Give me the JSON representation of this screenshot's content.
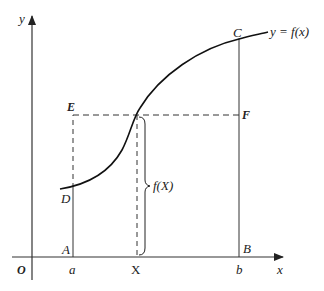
{
  "diagram": {
    "type": "function-graph-area-illustration",
    "axes": {
      "x_label": "x",
      "y_label": "y",
      "origin_label": "O"
    },
    "curve_label": "y = f(x)",
    "points": {
      "A": "A",
      "B": "B",
      "C": "C",
      "D": "D",
      "E": "E",
      "F": "F"
    },
    "x_ticks": {
      "a": "a",
      "X": "X",
      "b": "b"
    },
    "brace_label": "f(X)",
    "colors": {
      "line": "#222222",
      "axis": "#333333",
      "background": "#ffffff"
    }
  }
}
